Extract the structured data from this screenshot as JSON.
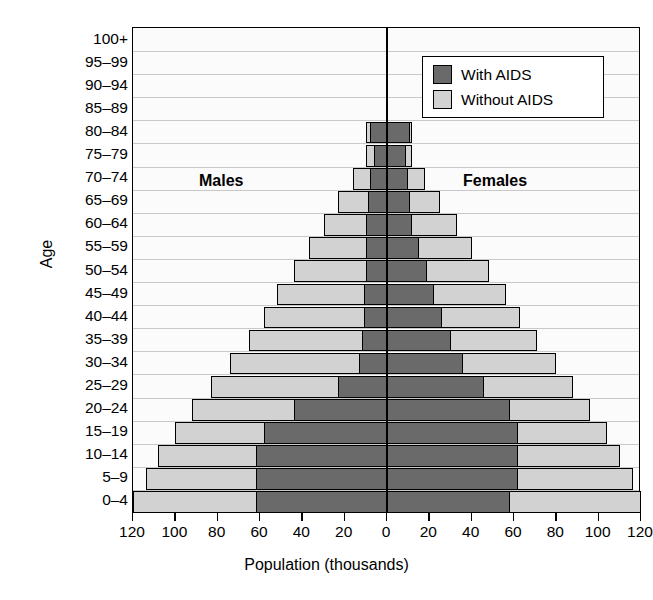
{
  "chart_data": {
    "type": "bar",
    "subtype": "population-pyramid",
    "title": "",
    "xlabel": "Population (thousands)",
    "ylabel": "Age",
    "xlim": [
      -120,
      120
    ],
    "xticks": [
      -120,
      -100,
      -80,
      -60,
      -40,
      -20,
      0,
      20,
      40,
      60,
      80,
      100,
      120
    ],
    "xticklabels": [
      "120",
      "100",
      "80",
      "60",
      "40",
      "20",
      "0",
      "20",
      "40",
      "60",
      "80",
      "100",
      "120"
    ],
    "grid": true,
    "legend_position": "top-right",
    "side_labels": {
      "left": "Males",
      "right": "Females"
    },
    "categories": [
      "100+",
      "95–99",
      "90–94",
      "85–89",
      "80–84",
      "75–79",
      "70–74",
      "65–69",
      "60–64",
      "55–59",
      "50–54",
      "45–49",
      "40–44",
      "35–39",
      "30–34",
      "25–29",
      "20–24",
      "15–19",
      "10–14",
      "5–9",
      "0–4"
    ],
    "legend": [
      {
        "label": "With AIDS",
        "color": "#6a6a6a"
      },
      {
        "label": "Without AIDS",
        "color": "#d2d2d2"
      }
    ],
    "series": [
      {
        "name": "Males with AIDS",
        "side": "left",
        "color": "#6a6a6a",
        "values": [
          0,
          0,
          0,
          0,
          8,
          6,
          8,
          9,
          10,
          10,
          10,
          11,
          11,
          12,
          13,
          23,
          44,
          58,
          62,
          62,
          62
        ]
      },
      {
        "name": "Males without AIDS",
        "side": "left",
        "color": "#d2d2d2",
        "values": [
          0,
          0,
          0,
          0,
          10,
          10,
          16,
          23,
          30,
          37,
          44,
          52,
          58,
          65,
          74,
          83,
          92,
          100,
          108,
          114,
          120
        ]
      },
      {
        "name": "Females with AIDS",
        "side": "right",
        "color": "#6a6a6a",
        "values": [
          0,
          0,
          0,
          0,
          11,
          9,
          10,
          11,
          12,
          15,
          19,
          22,
          26,
          30,
          36,
          46,
          58,
          62,
          62,
          62,
          58
        ]
      },
      {
        "name": "Females without AIDS",
        "side": "right",
        "color": "#d2d2d2",
        "values": [
          0,
          0,
          0,
          0,
          12,
          12,
          18,
          25,
          33,
          40,
          48,
          56,
          63,
          71,
          80,
          88,
          96,
          104,
          110,
          116,
          120
        ]
      }
    ]
  },
  "axes": {
    "y_title": "Age",
    "x_title": "Population (thousands)"
  }
}
